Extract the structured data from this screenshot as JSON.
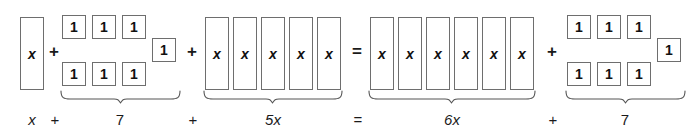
{
  "diagram": {
    "equation_text": "x + 7 + 5x = 6x + 7",
    "colors": {
      "background": "#ffffff",
      "tile_fill": "#ffffff",
      "tile_border": "#6e6e6e",
      "text": "#1a1a1a",
      "brace": "#555555"
    },
    "tile_labels": {
      "x": "x",
      "unit": "1"
    },
    "groups": [
      {
        "name": "left-x-group",
        "kind": "x-tiles",
        "count": 1,
        "tile_label": "x",
        "brace": false,
        "label": "x"
      },
      {
        "name": "left-constant-group",
        "kind": "unit-tiles",
        "count": 7,
        "tile_label": "1",
        "brace": true,
        "label": "7"
      },
      {
        "name": "left-five-x-group",
        "kind": "x-tiles",
        "count": 5,
        "tile_label": "x",
        "brace": true,
        "label": "5x"
      },
      {
        "name": "right-six-x-group",
        "kind": "x-tiles",
        "count": 6,
        "tile_label": "x",
        "brace": true,
        "label": "6x"
      },
      {
        "name": "right-constant-group",
        "kind": "unit-tiles",
        "count": 7,
        "tile_label": "1",
        "brace": true,
        "label": "7"
      }
    ],
    "tile_row_operators": {
      "plus_1": "+",
      "plus_2": "+",
      "equals": "=",
      "plus_3": "+"
    },
    "bottom_labels": {
      "term_x": "x",
      "plus_1": "+",
      "term_7_left": "7",
      "plus_2": "+",
      "term_5x": "5x",
      "equals": "=",
      "term_6x": "6x",
      "plus_3": "+",
      "term_7_right": "7"
    }
  }
}
